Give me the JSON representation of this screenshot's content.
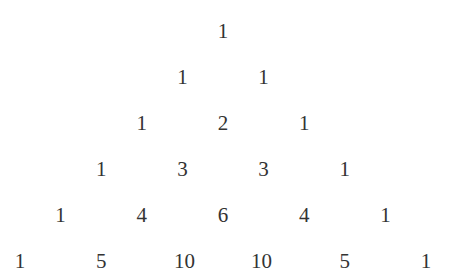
{
  "rows": [
    [
      1
    ],
    [
      1,
      1
    ],
    [
      1,
      2,
      1
    ],
    [
      1,
      3,
      3,
      1
    ],
    [
      1,
      4,
      6,
      4,
      1
    ],
    [
      1,
      5,
      10,
      10,
      5,
      1
    ]
  ],
  "style": {
    "text_color": "#333333",
    "background": "#ffffff"
  }
}
